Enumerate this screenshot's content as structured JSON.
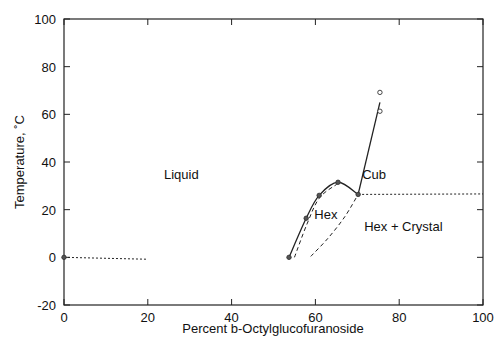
{
  "chart_data": {
    "type": "line",
    "title": "",
    "xlabel": "Percent b-Octylglucofuranoside",
    "ylabel": "Temperature, ˚C",
    "xlim": [
      0,
      100
    ],
    "ylim": [
      -20,
      100
    ],
    "x_ticks": [
      "0",
      "20",
      "40",
      "60",
      "80",
      "100"
    ],
    "y_ticks": [
      "-20",
      "0",
      "20",
      "40",
      "60",
      "80",
      "100"
    ],
    "grid": false,
    "legend": null,
    "annotations": [
      {
        "text": "Liquid",
        "x": 28,
        "y": 35
      },
      {
        "text": "Cub",
        "x": 74,
        "y": 35
      },
      {
        "text": "Hex",
        "x": 62.5,
        "y": 18
      },
      {
        "text": "Hex + Crystal",
        "x": 81,
        "y": 13
      }
    ],
    "series": [
      {
        "name": "Liquid/Hex boundary (solid)",
        "style": "solid",
        "x": [
          53.7,
          57.8,
          60.9,
          65.4,
          70.2
        ],
        "y": [
          0,
          16.4,
          26,
          31.5,
          26.4
        ]
      },
      {
        "name": "Cub/Liquid boundary (solid)",
        "style": "solid",
        "x": [
          70.2,
          75.4
        ],
        "y": [
          26.4,
          65
        ]
      },
      {
        "name": "Hex inner boundary (dashed)",
        "style": "dashed",
        "x": [
          55,
          58,
          61,
          65.4
        ],
        "y": [
          0,
          14,
          25,
          31
        ]
      },
      {
        "name": "Hex/Crystal boundary (dashed)",
        "style": "dashed",
        "x": [
          58.9,
          63,
          67,
          70.2
        ],
        "y": [
          0.4,
          8,
          17,
          26.4
        ]
      },
      {
        "name": "Crystal solidus (dotted)",
        "style": "dotted",
        "x": [
          70.2,
          100
        ],
        "y": [
          26.4,
          26.6
        ]
      },
      {
        "name": "Ice line (dotted)",
        "style": "dotted",
        "x": [
          0,
          20
        ],
        "y": [
          0,
          -0.8
        ]
      },
      {
        "name": "Filled points",
        "style": "marker-filled",
        "x": [
          0,
          53.7,
          57.8,
          60.9,
          65.4,
          70.2
        ],
        "y": [
          0,
          0,
          16.4,
          26,
          31.5,
          26.4
        ]
      },
      {
        "name": "Open points",
        "style": "marker-open",
        "x": [
          75.4,
          75.4
        ],
        "y": [
          69.2,
          61.3
        ]
      }
    ]
  }
}
